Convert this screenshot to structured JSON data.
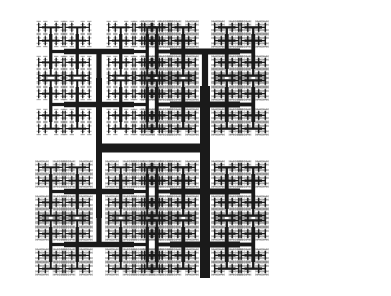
{
  "figure": {
    "type": "fractal-line-drawing",
    "width": 391,
    "height": 296,
    "background_color": "#ffffff",
    "stroke_color": "#1a1a1a",
    "faint_stroke_color": "#8a8a8a",
    "stroke_linecap": "butt"
  },
  "fractal": {
    "name": "H-tree",
    "description": "Recursive H shape; each H endpoint spawns two half-scale H shapes rotated 90 degrees. Stroke width halves at each recursion level.",
    "root": {
      "center_x": 152,
      "center_y": 148,
      "half_width": 53,
      "half_height": 70,
      "stroke_width": 10
    },
    "scale_factor": 0.707,
    "stroke_decay": 0.62,
    "min_stroke_width": 0.55,
    "levels_left_branch": 5,
    "levels_right_branch": 6,
    "trunk": {
      "orientation": "vertical",
      "x_center": 201,
      "y_top": 140,
      "y_bottom": 278,
      "thickness": 10
    },
    "crossbar": {
      "orientation": "horizontal",
      "y_center": 148,
      "x_left": 100,
      "x_right": 203,
      "thickness": 9
    },
    "left_post": {
      "orientation": "vertical",
      "x_center": 102,
      "y_top": 76,
      "y_bottom": 216,
      "thickness": 6
    },
    "content_bounds": {
      "x_min": 21,
      "y_min": 20,
      "x_max": 375,
      "y_max": 278
    }
  },
  "chart_data": {
    "type": "line",
    "xlabel": "",
    "ylabel": "",
    "xlim": [
      0,
      391
    ],
    "ylim": [
      0,
      296
    ],
    "grid": false,
    "legend": "none",
    "series": [
      {
        "name": "h-tree",
        "generator": "recursive-h",
        "origin": [
          152,
          148
        ],
        "initial_half_width": 53,
        "initial_half_height": 70,
        "depth": 6
      }
    ]
  }
}
